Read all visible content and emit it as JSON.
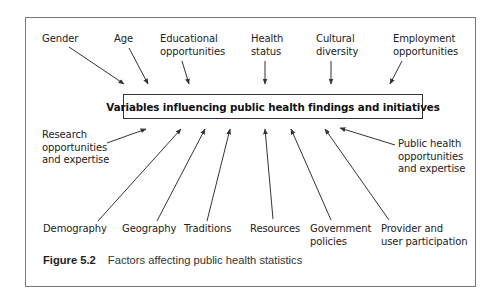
{
  "figure": {
    "central_node": "Variables influencing public health findings and initiatives",
    "caption_number": "Figure 5.2",
    "caption_text": "Factors affecting public health statistics"
  },
  "top_factors": [
    {
      "line1": "Gender",
      "line2": ""
    },
    {
      "line1": "Age",
      "line2": ""
    },
    {
      "line1": "Educational",
      "line2": "opportunities"
    },
    {
      "line1": "Health",
      "line2": "status"
    },
    {
      "line1": "Cultural",
      "line2": "diversity"
    },
    {
      "line1": "Employment",
      "line2": "opportunities"
    }
  ],
  "side_factors": [
    {
      "line1": "Research",
      "line2": "opportunities",
      "line3": "and expertise"
    },
    {
      "line1": "Public health",
      "line2": "opportunities",
      "line3": "and expertise"
    }
  ],
  "bottom_factors": [
    {
      "line1": "Demography",
      "line2": ""
    },
    {
      "line1": "Geography",
      "line2": ""
    },
    {
      "line1": "Traditions",
      "line2": ""
    },
    {
      "line1": "Resources",
      "line2": ""
    },
    {
      "line1": "Government",
      "line2": "policies"
    },
    {
      "line1": "Provider and",
      "line2": "user participation"
    }
  ],
  "colors": {
    "line": "#333333",
    "frame": "#7a7a7a",
    "text": "#222222"
  }
}
